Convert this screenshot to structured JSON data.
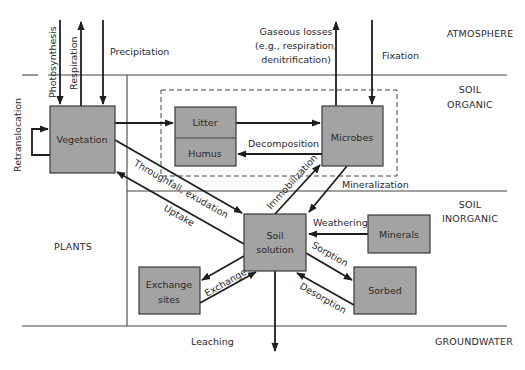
{
  "regions": {
    "atmosphere": "ATMOSPHERE",
    "soil_organic": [
      "SOIL",
      "ORGANIC"
    ],
    "soil_inorganic": [
      "SOIL",
      "INORGANIC"
    ],
    "plants": "PLANTS",
    "groundwater": "GROUNDWATER"
  },
  "boxes": {
    "vegetation": "Vegetation",
    "litter": "Litter",
    "humus": "Humus",
    "microbes": "Microbes",
    "soil_solution": [
      "Soil",
      "solution"
    ],
    "minerals": "Minerals",
    "sorbed": "Sorbed",
    "exchange_sites": [
      "Exchange",
      "sites"
    ]
  },
  "flows": {
    "photosynthesis": "Photosynthesis",
    "respiration": "Respiration",
    "precipitation": "Precipitation",
    "retranslocation": "Retranslocation",
    "gaseous_losses": [
      "Gaseous losses",
      "(e.g., respiration,",
      "denitrification)"
    ],
    "fixation": "Fixation",
    "decomposition": "Decomposition",
    "immobilization": "Immobilization",
    "mineralization": "Mineralization",
    "throughfall": "Throughfall, exudation",
    "uptake": "Uptake",
    "weathering": "Weathering",
    "sorption": "Sorption",
    "desorption": "Desorption",
    "exchange": "Exchange",
    "leaching": "Leaching"
  },
  "colors": {
    "box_fill": "#a3a3a3",
    "line": "#444444",
    "arrow": "#1e1e1e"
  }
}
